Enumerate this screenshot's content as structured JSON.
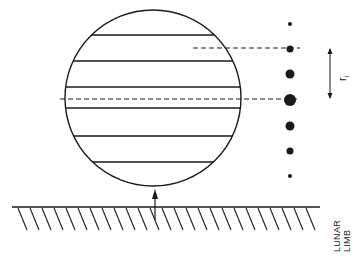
{
  "figure": {
    "type": "schematic",
    "stroke_color": "#1a1a1a",
    "background": "#ffffff"
  },
  "circle": {
    "cx": 153,
    "cy": 98,
    "r": 88,
    "stripes_y": [
      35,
      61,
      87,
      108,
      136,
      162
    ]
  },
  "dashed_lines": [
    {
      "y": 48,
      "x1": 193,
      "x2": 300
    },
    {
      "y": 99,
      "x1": 60,
      "x2": 300
    }
  ],
  "dots": [
    {
      "cx": 290,
      "cy": 24,
      "r": 2
    },
    {
      "cx": 290,
      "cy": 49,
      "r": 3.5
    },
    {
      "cx": 290,
      "cy": 74,
      "r": 4.5
    },
    {
      "cx": 290,
      "cy": 100,
      "r": 6
    },
    {
      "cx": 290,
      "cy": 126,
      "r": 4.5
    },
    {
      "cx": 290,
      "cy": 151,
      "r": 3.5
    },
    {
      "cx": 290,
      "cy": 176,
      "r": 2
    }
  ],
  "dimension": {
    "x": 330,
    "y1": 48,
    "y2": 99,
    "label_main": "r",
    "label_sub": "i"
  },
  "arrow": {
    "x": 155,
    "y_from": 206,
    "y_to": 189
  },
  "ground": {
    "y": 207,
    "x1": 12,
    "x2": 320,
    "hatch_spacing": 12
  },
  "labels": {
    "lunar": "LUNAR",
    "limb": "LIMB"
  }
}
